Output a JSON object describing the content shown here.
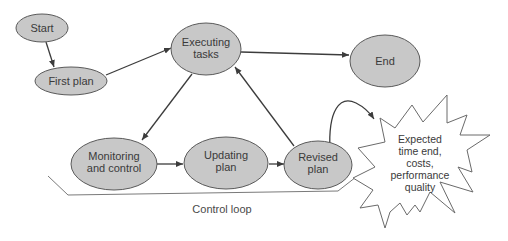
{
  "diagram": {
    "type": "process-flow",
    "nodes": {
      "start": {
        "line1": "Start"
      },
      "first_plan": {
        "line1": "First plan"
      },
      "executing": {
        "line1": "Executing",
        "line2": "tasks"
      },
      "end": {
        "line1": "End"
      },
      "monitoring": {
        "line1": "Monitoring",
        "line2": "and control"
      },
      "updating": {
        "line1": "Updating",
        "line2": "plan"
      },
      "revised": {
        "line1": "Revised",
        "line2": "plan"
      }
    },
    "callout": {
      "lines": [
        "Expected",
        "time end,",
        "costs,",
        "performance",
        "quality"
      ]
    },
    "loop_label": "Control loop",
    "edges": [
      {
        "from": "Start",
        "to": "First plan"
      },
      {
        "from": "First plan",
        "to": "Executing tasks"
      },
      {
        "from": "Executing tasks",
        "to": "End"
      },
      {
        "from": "Executing tasks",
        "to": "Monitoring and control"
      },
      {
        "from": "Monitoring and control",
        "to": "Updating plan"
      },
      {
        "from": "Updating plan",
        "to": "Revised plan"
      },
      {
        "from": "Revised plan",
        "to": "Executing tasks"
      },
      {
        "from": "Revised plan",
        "to": "Expected time end, costs, performance quality"
      }
    ],
    "colors": {
      "node_fill": "#c8c8c8",
      "node_stroke": "#5a5a5a",
      "edge": "#3c3c3c",
      "text": "#3a3a3a"
    }
  }
}
